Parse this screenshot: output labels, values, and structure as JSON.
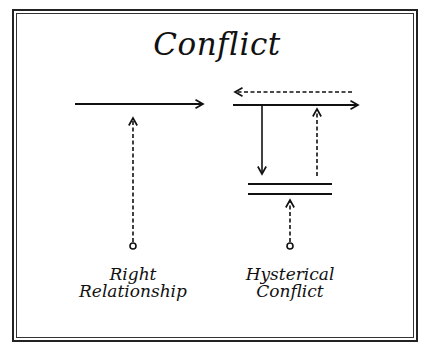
{
  "title": "Conflict",
  "panels": [
    {
      "id": "right-relationship",
      "label_line1": "Right",
      "label_line2": "Relationship",
      "elements": [
        {
          "type": "solid-arrow",
          "direction": "right"
        },
        {
          "type": "dashed-arrow",
          "direction": "up",
          "origin": "circle"
        }
      ]
    },
    {
      "id": "hysterical-conflict",
      "label_line1": "Hysterical",
      "label_line2": "Conflict",
      "elements": [
        {
          "type": "dashed-arrow",
          "direction": "left"
        },
        {
          "type": "solid-arrow",
          "direction": "right"
        },
        {
          "type": "solid-arrow",
          "direction": "down"
        },
        {
          "type": "dashed-arrow",
          "direction": "up"
        },
        {
          "type": "double-bar",
          "meaning": "blocked"
        },
        {
          "type": "dashed-arrow",
          "direction": "up",
          "origin": "circle"
        }
      ]
    }
  ],
  "colors": {
    "ink": "#111111",
    "background": "#ffffff"
  }
}
